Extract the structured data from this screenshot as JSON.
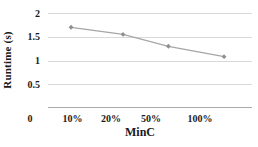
{
  "chart_data": {
    "type": "line",
    "title": "",
    "xlabel": "MinC",
    "ylabel": "Runtime (s)",
    "categories": [
      "10%",
      "20%",
      "50%",
      "100%"
    ],
    "series": [
      {
        "name": "Runtime",
        "values": [
          1.7,
          1.55,
          1.3,
          1.08
        ]
      }
    ],
    "ylim": [
      0,
      2
    ],
    "yticks": [
      0,
      0.5,
      1,
      1.5,
      2
    ],
    "ytick_labels": [
      "0",
      "0.5",
      "1",
      "1.5",
      "2"
    ],
    "grid": true,
    "legend_position": "none",
    "marker": "diamond",
    "line_color": "#a6a6a6",
    "marker_color": "#8f8f8f",
    "grid_color": "#d9d9d9",
    "axis_color": "#ababab",
    "tick_fractions": [
      0.12,
      0.309,
      0.505,
      0.745
    ],
    "x_fractions": [
      0.113,
      0.368,
      0.59,
      0.863
    ]
  }
}
